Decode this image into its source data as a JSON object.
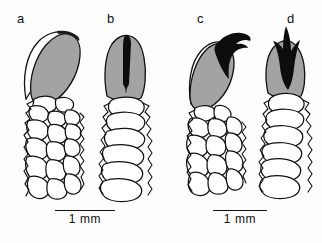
{
  "figure": {
    "type": "scientific-line-drawing",
    "background_color": "#fdfdfd",
    "ink_color": "#111111",
    "fill_gray": "#a3a3a3",
    "fill_black": "#0d0d0d",
    "fill_white": "#ffffff"
  },
  "panels": [
    {
      "id": "a",
      "label": "a",
      "view": "lateral",
      "apex_fill": "gray",
      "has_black_spine": false,
      "shaft_style": "polygonal-cells",
      "label_x": 17,
      "label_y": 12
    },
    {
      "id": "b",
      "label": "b",
      "view": "frontal",
      "apex_fill": "gray",
      "has_black_spine": true,
      "spine_shape": "narrow-wedge",
      "shaft_style": "stacked-segments",
      "label_x": 107,
      "label_y": 12
    },
    {
      "id": "c",
      "label": "c",
      "view": "lateral",
      "apex_fill": "gray",
      "has_black_spine": true,
      "spine_shape": "curved-hook",
      "shaft_style": "polygonal-cells",
      "label_x": 197,
      "label_y": 12
    },
    {
      "id": "d",
      "label": "d",
      "view": "frontal",
      "apex_fill": "gray",
      "has_black_spine": true,
      "spine_shape": "flame-spike",
      "shaft_style": "stacked-segments",
      "label_x": 287,
      "label_y": 12
    }
  ],
  "scale_bars": [
    {
      "id": "scale-left",
      "label": "1 mm",
      "x": 55,
      "y": 210,
      "width": 60
    },
    {
      "id": "scale-right",
      "label": "1 mm",
      "x": 213,
      "y": 210,
      "width": 54
    }
  ]
}
